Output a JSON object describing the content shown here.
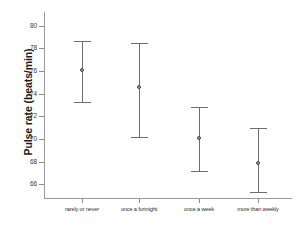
{
  "chart_data": {
    "type": "scatter",
    "title": "",
    "xlabel": "",
    "ylabel": "Pulse rate (beats/min)",
    "categories": [
      "rarely or never",
      "once a fortnight",
      "once a week",
      "more than weekly"
    ],
    "values": [
      76.1,
      74.6,
      70.1,
      67.9
    ],
    "error_low": [
      73.3,
      70.2,
      67.2,
      65.3
    ],
    "error_high": [
      78.6,
      78.5,
      72.8,
      71.0
    ],
    "ylim": [
      64.8,
      81.2
    ],
    "yticks": [
      80,
      78,
      76,
      74,
      72,
      70,
      68,
      66
    ],
    "ytick_labels": [
      "80",
      "78",
      "76",
      "74",
      "72",
      "70",
      "68",
      "66"
    ],
    "grid": false,
    "legend": null,
    "marker": "circle",
    "errorbar_style": "capped-vertical",
    "colors": {
      "axis": "#9a9a9a",
      "errorbar": "#6d6d6d",
      "marker_face": "#9b9b9b",
      "marker_edge": "#4a4a4a",
      "text": "#1a1a1a",
      "background": "#ffffff"
    }
  },
  "axis_geometry": {
    "plot_left": 44,
    "plot_right": 292,
    "plot_top": 12,
    "plot_bottom": 198,
    "y_top_value": 81.2,
    "y_bottom_value": 64.8,
    "x_positions": [
      82,
      139,
      199,
      258
    ]
  }
}
